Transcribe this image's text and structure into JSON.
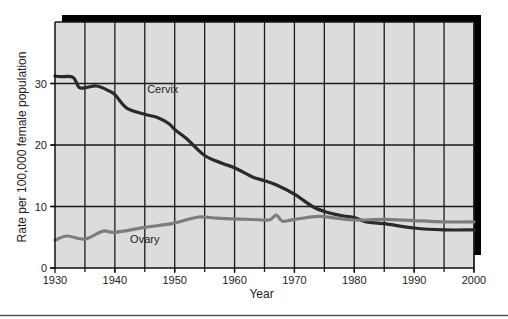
{
  "chart_data": {
    "type": "line",
    "title": "",
    "xlabel": "Year",
    "ylabel": "Rate per 100,000 female population",
    "xlim": [
      1930,
      2000
    ],
    "ylim": [
      0,
      40
    ],
    "x_ticks": [
      1930,
      1940,
      1950,
      1960,
      1970,
      1980,
      1990,
      2000
    ],
    "x_tick_labels": [
      "1930",
      "1940",
      "1950",
      "1960",
      "1970",
      "1980",
      "1990",
      "2000"
    ],
    "x_minor_gridlines": [
      1935,
      1945,
      1955,
      1965,
      1975,
      1985,
      1995
    ],
    "y_ticks": [
      0,
      10,
      20,
      30
    ],
    "y_tick_labels": [
      "0",
      "10",
      "20",
      "30"
    ],
    "grid": true,
    "legend": "none (inline series labels)",
    "colors": {
      "plot_background": "#dcdcdc",
      "grid": "#1a1a1a",
      "shadow": "#000000",
      "cervix": "#2a2a2a",
      "ovary": "#7d7d7d"
    },
    "series": [
      {
        "name": "Cervix",
        "label": "Cervix",
        "label_at": [
          1948,
          28.5
        ],
        "x": [
          1930,
          1931,
          1933,
          1934,
          1935,
          1937,
          1939,
          1940,
          1942,
          1945,
          1947,
          1949,
          1950,
          1952,
          1955,
          1958,
          1960,
          1963,
          1965,
          1967,
          1970,
          1973,
          1975,
          1978,
          1980,
          1982,
          1985,
          1990,
          1995,
          2000
        ],
        "values": [
          31.2,
          31.1,
          31.0,
          29.4,
          29.3,
          29.6,
          28.8,
          28.2,
          26.0,
          25.0,
          24.5,
          23.5,
          22.5,
          21.0,
          18.3,
          17.0,
          16.3,
          14.8,
          14.2,
          13.5,
          12.0,
          10.0,
          9.2,
          8.5,
          8.2,
          7.5,
          7.2,
          6.5,
          6.2,
          6.2
        ]
      },
      {
        "name": "Ovary",
        "label": "Ovary",
        "label_at": [
          1945,
          4.0
        ],
        "x": [
          1930,
          1932,
          1935,
          1938,
          1940,
          1945,
          1948,
          1950,
          1954,
          1957,
          1960,
          1965,
          1966,
          1967,
          1968,
          1970,
          1974,
          1977,
          1980,
          1985,
          1990,
          1995,
          2000
        ],
        "values": [
          4.5,
          5.2,
          4.7,
          6.0,
          5.8,
          6.6,
          7.0,
          7.3,
          8.3,
          8.1,
          8.0,
          7.8,
          7.9,
          8.6,
          7.6,
          7.9,
          8.4,
          8.1,
          7.8,
          7.9,
          7.7,
          7.5,
          7.5
        ]
      }
    ]
  }
}
